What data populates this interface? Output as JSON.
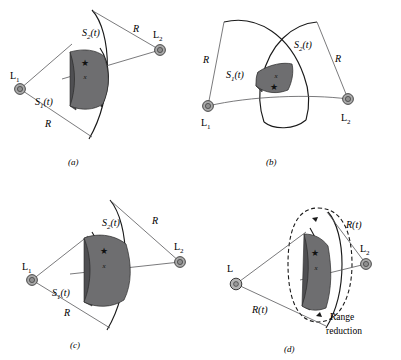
{
  "figure": {
    "type": "technical-diagram",
    "colors": {
      "shade_fill": "#6e6e70",
      "shade_side": "#4f4f52",
      "line": "#58585a",
      "arc": "#1a1a1a",
      "landmark_fill": "#a8a8a8",
      "background": "#ffffff"
    },
    "symbols": {
      "target_star": "★",
      "target_label": "x"
    }
  },
  "panels": [
    {
      "id": "a",
      "caption": "(a)",
      "landmark_left": "L",
      "landmark_left_sub": "1",
      "landmark_right": "L",
      "landmark_right_sub": "2",
      "field_left": "S",
      "field_left_sub": "1",
      "field_left_arg": "(t)",
      "field_right": "S",
      "field_right_sub": "2",
      "field_right_arg": "(t)",
      "range_upper": "R",
      "range_lower": "R",
      "target_star": "★",
      "target_label": "x"
    },
    {
      "id": "b",
      "caption": "(b)",
      "landmark_left": "L",
      "landmark_left_sub": "1",
      "landmark_right": "L",
      "landmark_right_sub": "2",
      "field_left": "S",
      "field_left_sub": "1",
      "field_left_arg": "(t)",
      "field_right": "S",
      "field_right_sub": "2",
      "field_right_arg": "(t)",
      "range_left": "R",
      "range_right": "R",
      "target_star": "★",
      "target_label": "x"
    },
    {
      "id": "c",
      "caption": "(c)",
      "landmark_left": "L",
      "landmark_left_sub": "1",
      "landmark_right": "L",
      "landmark_right_sub": "2",
      "field_left": "S",
      "field_left_sub": "1",
      "field_left_arg": "(t)",
      "field_right": "S",
      "field_right_sub": "2",
      "field_right_arg": "(t)",
      "range_upper": "R",
      "range_lower": "R",
      "target_star": "★",
      "target_label": "x"
    },
    {
      "id": "d",
      "caption": "(d)",
      "landmark_left": "L",
      "landmark_left_sub": "",
      "landmark_right": "L",
      "landmark_right_sub": "2",
      "range_upper": "R(t)",
      "range_lower": "R(t)",
      "annotation_line1": "Range",
      "annotation_line2": "reduction",
      "target_star": "★",
      "target_label": "x"
    }
  ]
}
